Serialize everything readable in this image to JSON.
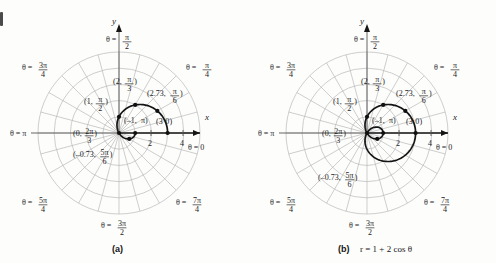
{
  "figure": {
    "background_color": "#fdfdfc",
    "curve_color": "#151515",
    "grid_color": "#b9b9b9",
    "axis_color": "#151515"
  },
  "panels": [
    {
      "id": "a",
      "caption_label": "(a)",
      "caption_equation": "",
      "curve_description": "upper half of limacon r = 1 + 2 cos theta, theta from 0 to pi"
    },
    {
      "id": "b",
      "caption_label": "(b)",
      "caption_equation": "r = 1 + 2 cos θ",
      "curve_description": "full limacon r = 1 + 2 cos theta with inner loop"
    }
  ],
  "axis_labels": {
    "x": "x",
    "y": "y"
  },
  "angle_labels": [
    {
      "theta_text": "θ = 0",
      "prefix": "θ =",
      "value": "0",
      "numer": "",
      "denom": "",
      "angle_deg": 0
    },
    {
      "theta_text": "θ = π/4",
      "prefix": "θ =",
      "value": "",
      "numer": "π",
      "denom": "4",
      "angle_deg": 45
    },
    {
      "theta_text": "θ = π/2",
      "prefix": "θ =",
      "value": "",
      "numer": "π",
      "denom": "2",
      "angle_deg": 90
    },
    {
      "theta_text": "θ = 3π/4",
      "prefix": "θ =",
      "value": "",
      "numer": "3π",
      "denom": "4",
      "angle_deg": 135
    },
    {
      "theta_text": "θ = π",
      "prefix": "θ =",
      "value": "π",
      "numer": "",
      "denom": "",
      "angle_deg": 180
    },
    {
      "theta_text": "θ = 5π/4",
      "prefix": "θ =",
      "value": "",
      "numer": "5π",
      "denom": "4",
      "angle_deg": 225
    },
    {
      "theta_text": "θ = 3π/2",
      "prefix": "θ =",
      "value": "",
      "numer": "3π",
      "denom": "2",
      "angle_deg": 270
    },
    {
      "theta_text": "θ = 7π/4",
      "prefix": "θ =",
      "value": "",
      "numer": "7π",
      "denom": "4",
      "angle_deg": 315
    }
  ],
  "radial_ticks": [
    {
      "label": "2",
      "r": 2
    },
    {
      "label": "4",
      "r": 4
    }
  ],
  "points": [
    {
      "label": "(3, 0)",
      "open": "(",
      "r_text": "3",
      "theta_numer": "",
      "theta_denom": "",
      "theta_plain": "0",
      "close": ")",
      "r": 3,
      "theta_deg": 0
    },
    {
      "label": "(2.73, π/6)",
      "open": "(",
      "r_text": "2.73,",
      "theta_numer": "π",
      "theta_denom": "6",
      "theta_plain": "",
      "close": ")",
      "r": 2.73,
      "theta_deg": 30
    },
    {
      "label": "(2, π/3)",
      "open": "(",
      "r_text": "2,",
      "theta_numer": "π",
      "theta_denom": "3",
      "theta_plain": "",
      "close": ")",
      "r": 2,
      "theta_deg": 60
    },
    {
      "label": "(1, π/2)",
      "open": "(",
      "r_text": "1,",
      "theta_numer": "π",
      "theta_denom": "2",
      "theta_plain": "",
      "close": ")",
      "r": 1,
      "theta_deg": 90
    },
    {
      "label": "(0, 2π/3)",
      "open": "(",
      "r_text": "0,",
      "theta_numer": "2π",
      "theta_denom": "3",
      "theta_plain": "",
      "close": ")",
      "r": 0,
      "theta_deg": 120
    },
    {
      "label": "(-0.73, 5π/6)",
      "open": "(",
      "r_text": "–0.73,",
      "theta_numer": "5π",
      "theta_denom": "6",
      "theta_plain": "",
      "close": ")",
      "r": -0.73,
      "theta_deg": 150
    },
    {
      "label": "(-1, π)",
      "open": "(",
      "r_text": "–1,",
      "theta_numer": "",
      "theta_denom": "",
      "theta_plain": "π",
      "close": ")",
      "r": -1,
      "theta_deg": 180
    }
  ],
  "chart_data": {
    "type": "line",
    "title": "",
    "subtitle": "",
    "xlabel": "x",
    "ylabel": "y",
    "equation": "r = 1 + 2 cos θ",
    "coordinate_system": "polar",
    "grid": true,
    "legend": "none",
    "rmax": 5,
    "grid_circles_r": [
      1,
      2,
      3,
      4,
      5
    ],
    "grid_rays_deg": [
      0,
      15,
      30,
      45,
      60,
      75,
      90,
      105,
      120,
      135,
      150,
      165,
      180,
      195,
      210,
      225,
      240,
      255,
      270,
      285,
      300,
      315,
      330,
      345
    ],
    "axis_tick_labels": [
      "2",
      "4"
    ],
    "series": [
      {
        "name": "(a) upper half arc",
        "theta_range_deg": [
          0,
          180
        ],
        "points_theta_deg": [
          0,
          30,
          60,
          90,
          120,
          150,
          180
        ],
        "points_r": [
          3,
          2.73,
          2,
          1,
          0,
          -0.73,
          -1
        ]
      },
      {
        "name": "(b) full limacon with inner loop",
        "theta_range_deg": [
          0,
          360
        ],
        "points_theta_deg": [
          0,
          30,
          60,
          90,
          120,
          150,
          180
        ],
        "points_r": [
          3,
          2.73,
          2,
          1,
          0,
          -0.73,
          -1
        ]
      }
    ]
  }
}
